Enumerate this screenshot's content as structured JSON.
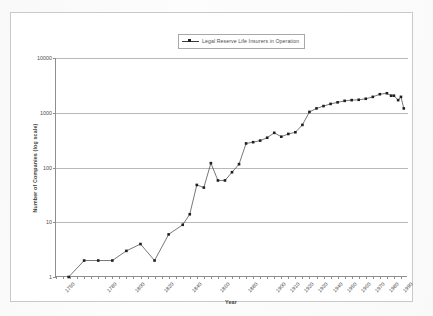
{
  "figure": {
    "axis_title_x": "Year",
    "axis_title_y": "Number of Companies (log scale)",
    "legend_label": "Legal Reserve Life Insurers in Operation",
    "legend_marker_icon": "line-marker-icon",
    "series_color": "#3d3d3d",
    "marker_color": "#1f1f1f",
    "gridline_color": "#b9b9b9",
    "axis_color": "#8e8e8e",
    "frame_color": "#c9c9c9"
  },
  "chart_data": {
    "type": "line",
    "title": "",
    "subtitle": "",
    "xlabel": "Year",
    "ylabel": "Number of Companies (log scale)",
    "yscale": "log",
    "ylim": [
      1,
      10000
    ],
    "ytick_labels": [
      "10000",
      "1000",
      "100",
      "10",
      "1"
    ],
    "ytick_values": [
      10000,
      1000,
      100,
      10,
      1
    ],
    "grid": true,
    "legend_position": "top-center",
    "xtick_labels": [
      "1750",
      "1780",
      "1800",
      "1820",
      "1840",
      "1860",
      "1880",
      "1900",
      "1910",
      "1920",
      "1930",
      "1940",
      "1950",
      "1960",
      "1970",
      "1980",
      "1990"
    ],
    "series": [
      {
        "name": "Legal Reserve Life Insurers in Operation",
        "x": [
          1759,
          1770,
          1780,
          1790,
          1800,
          1810,
          1820,
          1830,
          1840,
          1845,
          1850,
          1855,
          1860,
          1865,
          1870,
          1875,
          1880,
          1885,
          1890,
          1895,
          1900,
          1905,
          1910,
          1915,
          1920,
          1925,
          1930,
          1935,
          1940,
          1945,
          1950,
          1955,
          1960,
          1965,
          1970,
          1975,
          1980,
          1985,
          1988,
          1990,
          1993,
          1995,
          1997
        ],
        "y": [
          1,
          2,
          2,
          2,
          3,
          4,
          2,
          6,
          9,
          14,
          48,
          43,
          120,
          58,
          58,
          82,
          115,
          275,
          290,
          310,
          350,
          430,
          365,
          410,
          440,
          600,
          1035,
          1200,
          1325,
          1450,
          1550,
          1650,
          1700,
          1725,
          1800,
          1950,
          2180,
          2270,
          2050,
          2050,
          1700,
          1950,
          1200
        ]
      }
    ]
  }
}
